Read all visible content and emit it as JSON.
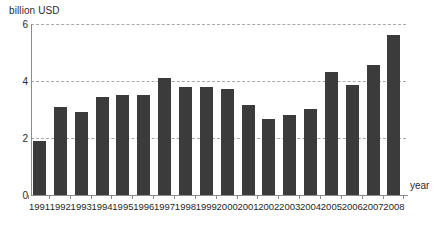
{
  "chart_data": {
    "type": "bar",
    "title": "",
    "subtitle": "",
    "xlabel": "year",
    "ylabel": "billion USD",
    "ylim": [
      0,
      6
    ],
    "yticks": [
      0,
      2,
      4,
      6
    ],
    "grid": true,
    "legend": false,
    "bar_color": "#3b3b3b",
    "gridline_color": "#a9a9a9",
    "axis_color": "#8c8c8c",
    "categories": [
      "1991",
      "1992",
      "1993",
      "1994",
      "1995",
      "1996",
      "1997",
      "1998",
      "1999",
      "2000",
      "2001",
      "2002",
      "2003",
      "2004",
      "2005",
      "2006",
      "2007",
      "2008"
    ],
    "values": [
      1.88,
      3.08,
      2.9,
      3.45,
      3.5,
      3.52,
      4.1,
      3.78,
      3.8,
      3.72,
      3.15,
      2.65,
      2.8,
      3.02,
      4.33,
      3.85,
      4.57,
      5.6
    ]
  },
  "axes": {
    "y_title": "billion USD",
    "x_title": "year",
    "y_tick_labels": [
      "6",
      "4",
      "2",
      "0"
    ]
  }
}
